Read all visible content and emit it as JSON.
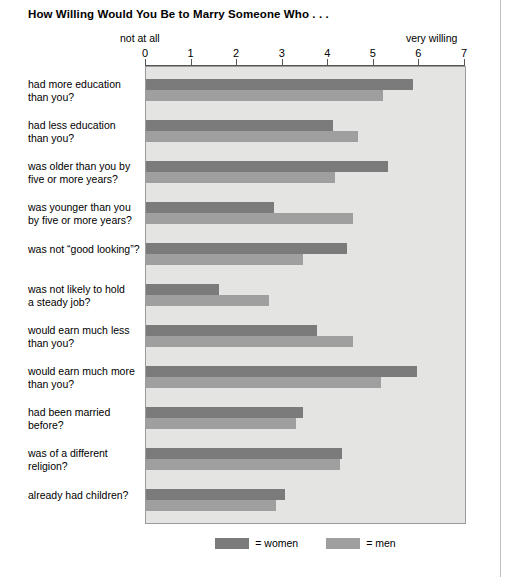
{
  "chart_data": {
    "type": "bar",
    "orientation": "horizontal",
    "title": "How Willing Would You Be to Marry Someone Who . . .",
    "xlabel": "",
    "ylabel": "",
    "xlim": [
      0,
      7
    ],
    "grid": false,
    "axis_low_caption": "not at all",
    "axis_high_caption": "very willing",
    "tick_labels": [
      "0",
      "1",
      "2",
      "3",
      "4",
      "5",
      "6",
      "7"
    ],
    "tick_values": [
      0,
      1,
      2,
      3,
      4,
      5,
      6,
      7
    ],
    "legend_position": "bottom",
    "categories": [
      "had more education than you?",
      "had less education than you?",
      "was older than you by five or more years?",
      "was younger than you by five or more years?",
      "was not “good looking”?",
      "was not likely to hold a steady job?",
      "would earn much less than you?",
      "would earn much more than you?",
      "had been married before?",
      "was of a different religion?",
      "already had children?"
    ],
    "category_lines": [
      [
        "had more education",
        "than you?"
      ],
      [
        "had less education",
        "than you?"
      ],
      [
        "was older than you by",
        "five or more years?"
      ],
      [
        "was younger than you",
        "by five or more years?"
      ],
      [
        "was not “good looking”?"
      ],
      [
        "was not likely to hold",
        "a steady job?"
      ],
      [
        "would earn much less",
        "than you?"
      ],
      [
        "would earn much more",
        "than you?"
      ],
      [
        "had been married",
        "before?"
      ],
      [
        "was of a different",
        "religion?"
      ],
      [
        "already had children?"
      ]
    ],
    "series": [
      {
        "name": "women",
        "legend_label": "= women",
        "color": "#7b7b7b",
        "values": [
          5.85,
          4.1,
          5.3,
          2.8,
          4.4,
          1.6,
          3.75,
          5.95,
          3.45,
          4.3,
          3.05
        ]
      },
      {
        "name": "men",
        "legend_label": "= men",
        "color": "#9f9f9f",
        "values": [
          5.2,
          4.65,
          4.15,
          4.55,
          3.45,
          2.7,
          4.55,
          5.15,
          3.3,
          4.25,
          2.85
        ]
      }
    ]
  }
}
